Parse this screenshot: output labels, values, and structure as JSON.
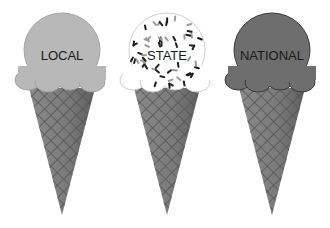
{
  "cones": [
    {
      "id": "local",
      "label": "LOCAL",
      "scoop_color": "#b8b8b8",
      "scoop_outline": "#a3a3a3",
      "sprinkles": false
    },
    {
      "id": "state",
      "label": "STATE",
      "scoop_color": "#ffffff",
      "scoop_outline": "#cfcfcf",
      "sprinkles": true
    },
    {
      "id": "national",
      "label": "NATIONAL",
      "scoop_color": "#6e6e6e",
      "scoop_outline": "#3a3a3a",
      "sprinkles": false
    }
  ],
  "cone_color": "#7c7c7c",
  "waffle_line_color": "#4f4f4f"
}
